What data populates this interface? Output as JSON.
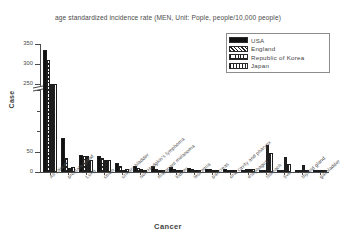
{
  "chart_data": {
    "type": "bar",
    "title": "age standardized incidence rate (MEN, Unit: Pople, people/10,000 people)",
    "xlabel": "Cancer",
    "ylabel": "Case",
    "grid": false,
    "legend_position": "top-right",
    "axis_break": true,
    "ylim": [
      0,
      350
    ],
    "yticks": [
      0,
      50,
      100,
      150,
      200,
      250,
      300,
      350
    ],
    "ytick_labels": [
      "0",
      "50",
      "",
      "",
      "",
      "250",
      "300",
      "350"
    ],
    "categories": [
      "All cancer",
      "prostate gland",
      "Lung",
      "colon",
      "urinary bladder",
      "non-Hodgkin's lymphoma",
      "malignant melanoma",
      "kidney",
      "leukemia",
      "pancreas",
      "oral cavity and pharynx",
      "esophagus",
      "stomach",
      "liver",
      "thyroid gland",
      "gallbladder"
    ],
    "series": [
      {
        "name": "USA",
        "color": "#111111",
        "pattern": "solid",
        "values": [
          335,
          83,
          42,
          38,
          22,
          14,
          14,
          13,
          11,
          8,
          7,
          5,
          4,
          5,
          5,
          1
        ]
      },
      {
        "name": "England",
        "color": "#222222",
        "pattern": "diagonal-hatch",
        "values": [
          310,
          35,
          38,
          34,
          15,
          10,
          7,
          7,
          8,
          7,
          5,
          7,
          6,
          3,
          1,
          1
        ]
      },
      {
        "name": "Republic of Korea",
        "color": "#222222",
        "pattern": "cross-hatch",
        "values": [
          245,
          11,
          38,
          30,
          6,
          7,
          1,
          4,
          5,
          5,
          5,
          8,
          65,
          36,
          16,
          4
        ]
      },
      {
        "name": "Japan",
        "color": "#222222",
        "pattern": "vertical-lines",
        "values": [
          230,
          13,
          30,
          29,
          7,
          6,
          1,
          4,
          4,
          6,
          3,
          7,
          47,
          20,
          2,
          3
        ]
      }
    ]
  },
  "legend": {
    "items": [
      {
        "label": "USA",
        "pattern_class": "p-usa"
      },
      {
        "label": "England",
        "pattern_class": "p-eng"
      },
      {
        "label": "Republic of Korea",
        "pattern_class": "p-kor"
      },
      {
        "label": "Japan",
        "pattern_class": "p-jpn"
      }
    ]
  }
}
